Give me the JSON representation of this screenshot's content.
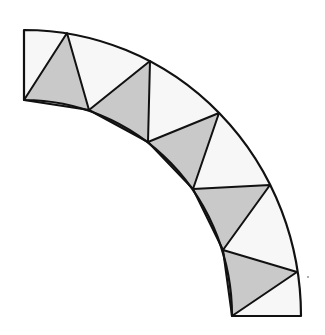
{
  "diagram": {
    "type": "quarter-annulus-triangulation",
    "colors": {
      "background": "#ffffff",
      "band_fill": "#f7f7f7",
      "shaded_fill": "#c9c9c9",
      "stroke": "#111111"
    },
    "center": [
      24,
      316
    ],
    "outer_vertices": [
      [
        24,
        30
      ],
      [
        67,
        33
      ],
      [
        150,
        61
      ],
      [
        219,
        113
      ],
      [
        270,
        185
      ],
      [
        297,
        272
      ],
      [
        301,
        316
      ]
    ],
    "inner_vertices": [
      [
        24,
        100
      ],
      [
        89,
        110
      ],
      [
        148,
        142
      ],
      [
        193,
        189
      ],
      [
        223,
        250
      ],
      [
        232,
        316
      ]
    ],
    "shaded_triangles": [
      [
        [
          24,
          100
        ],
        [
          67,
          33
        ],
        [
          89,
          110
        ]
      ],
      [
        [
          89,
          110
        ],
        [
          150,
          61
        ],
        [
          148,
          142
        ]
      ],
      [
        [
          148,
          142
        ],
        [
          219,
          113
        ],
        [
          193,
          189
        ]
      ],
      [
        [
          193,
          189
        ],
        [
          270,
          185
        ],
        [
          223,
          250
        ]
      ],
      [
        [
          223,
          250
        ],
        [
          297,
          272
        ],
        [
          232,
          316
        ]
      ]
    ],
    "stray_dot": [
      308,
      277
    ]
  }
}
